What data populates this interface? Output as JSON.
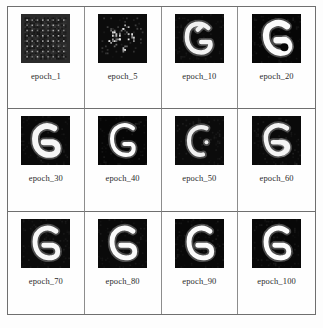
{
  "figure": {
    "name": "gan-training-progress-grid",
    "rows": 3,
    "cols": 4,
    "background_color": "#fdfdfd",
    "border_color": "#6f6f6f",
    "sample_background_color": "#0a0a0a",
    "sample_stroke_color": "#ffffff"
  },
  "chart_data": {
    "type": "table",
    "title": "",
    "xlabel": "",
    "ylabel": "",
    "categories": [
      "epoch_1",
      "epoch_5",
      "epoch_10",
      "epoch_20",
      "epoch_30",
      "epoch_40",
      "epoch_50",
      "epoch_60",
      "epoch_70",
      "epoch_80",
      "epoch_90",
      "epoch_100"
    ],
    "values": [
      1,
      5,
      10,
      20,
      30,
      40,
      50,
      60,
      70,
      80,
      90,
      100
    ]
  },
  "cells": [
    {
      "label": "epoch_1",
      "epoch": 1,
      "render": "noise-checker",
      "description": "dark checkerboard noise, no recognizable glyph",
      "bg": "#2a2a2a",
      "fg": "#8c8c8c"
    },
    {
      "label": "epoch_5",
      "epoch": 5,
      "render": "sparse-blobs",
      "description": "black field with scattered bright speckles",
      "bg": "#0c0c0c",
      "fg": "#e8e8e8"
    },
    {
      "label": "epoch_10",
      "epoch": 10,
      "render": "glyph-rough",
      "description": "rough open G / 6 shape emerging",
      "bg": "#0a0a0a",
      "fg": "#f2f2f2"
    },
    {
      "label": "epoch_20",
      "epoch": 20,
      "render": "glyph-blocky",
      "description": "thick blocky G with filled hook",
      "bg": "#060606",
      "fg": "#fafafa"
    },
    {
      "label": "epoch_30",
      "epoch": 30,
      "render": "glyph-thick",
      "description": "bold G with heavy lower bar",
      "bg": "#090909",
      "fg": "#f6f6f6"
    },
    {
      "label": "epoch_40",
      "epoch": 40,
      "render": "glyph-thin",
      "description": "thin curved G with short crossbar",
      "bg": "#060606",
      "fg": "#fcfcfc"
    },
    {
      "label": "epoch_50",
      "epoch": 50,
      "render": "glyph-broken",
      "description": "C-shaped arc with detached bright dot",
      "bg": "#0b0b0b",
      "fg": "#f0f0f0"
    },
    {
      "label": "epoch_60",
      "epoch": 60,
      "render": "glyph-loopy",
      "description": "G with looping tail curling to the right",
      "bg": "#0a0a0a",
      "fg": "#f4f4f4"
    },
    {
      "label": "epoch_70",
      "epoch": 70,
      "render": "glyph-clean",
      "description": "clean G with horizontal crossbar",
      "bg": "#0b0b0b",
      "fg": "#f8f8f8"
    },
    {
      "label": "epoch_80",
      "epoch": 80,
      "render": "glyph-clean",
      "description": "clean G, slightly bolder stroke",
      "bg": "#0a0a0a",
      "fg": "#fafafa"
    },
    {
      "label": "epoch_90",
      "epoch": 90,
      "render": "glyph-clean",
      "description": "clean sharp G",
      "bg": "#080808",
      "fg": "#fbfbfb"
    },
    {
      "label": "epoch_100",
      "epoch": 100,
      "render": "glyph-clean",
      "description": "final converged G sample",
      "bg": "#080808",
      "fg": "#fdfdfd"
    }
  ]
}
